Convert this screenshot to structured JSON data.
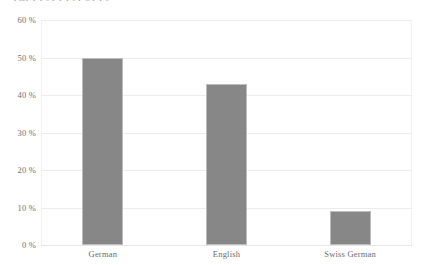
{
  "caption": {
    "cropped_top_line": "pgjy  p  p j   y y p   j p g  y p j"
  },
  "colors": {
    "bar_fill": "#878787",
    "bar_stroke": "#bdbdbd",
    "gridline": "#ececed",
    "axis_text": "#6b6b70",
    "background": "#ffffff"
  },
  "chart_data": {
    "type": "bar",
    "title": "",
    "subtitle": "",
    "xlabel": "",
    "ylabel": "",
    "categories": [
      "German",
      "English",
      "Swiss German"
    ],
    "values": [
      50,
      43,
      9
    ],
    "value_unit": "%",
    "ylim": [
      0,
      60
    ],
    "yticks": [
      0,
      10,
      20,
      30,
      40,
      50,
      60
    ],
    "ytick_labels": [
      "0 %",
      "10 %",
      "20 %",
      "30 %",
      "40 %",
      "50 %",
      "60 %"
    ],
    "grid": true,
    "grid_axis": "y",
    "legend": false,
    "legend_position": "none",
    "series": [
      {
        "name": "share",
        "values": [
          50,
          43,
          9
        ]
      }
    ]
  }
}
